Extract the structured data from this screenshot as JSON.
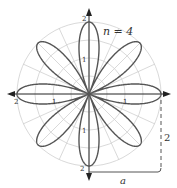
{
  "figure": {
    "label_n": "n = 4",
    "label_a": "a",
    "label_2": "2",
    "tick_labels": {
      "top": "2",
      "upper": "1",
      "lower": "1",
      "bottom": "2",
      "left_outer": "2",
      "left_inner": "1",
      "right_inner": "1"
    },
    "curve": "r = a cos(nθ)",
    "a": 2,
    "n": 4,
    "petals": 8,
    "grid_circles": [
      0.5,
      1,
      1.5,
      2
    ],
    "colors": {
      "curve": "#555555",
      "grid": "#cccccc",
      "axis": "#222222"
    }
  }
}
